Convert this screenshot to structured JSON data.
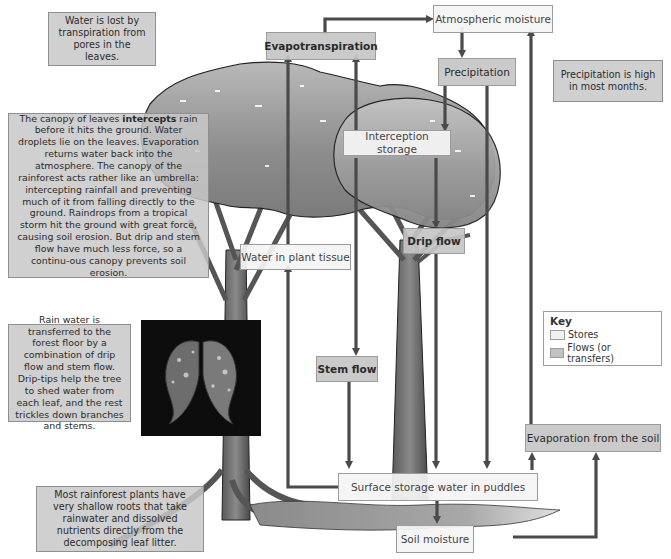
{
  "diagram": {
    "type": "rainforest nutrient/water cycle (stores and flows)",
    "colors": {
      "store_fill": "#f1f1f1",
      "flow_fill": "#c6c6c6",
      "arrow": "#4a4a4a",
      "note_fill": "#c8c8c8"
    }
  },
  "notes": {
    "transpiration": "Water is lost by transpiration from pores in the leaves.",
    "canopy_prefix": "The canopy of leaves ",
    "canopy_bold": "intercepts",
    "canopy_suffix": " rain before it hits the ground. Water droplets lie on the leaves. Evaporation returns water back into the atmosphere. The canopy of the rainforest acts rather like an umbrella: intercepting rainfall and preventing much of it from falling directly to the ground. Raindrops from a tropical storm hit the ground with great force, causing soil erosion. But drip and stem flow have much less force, so a continu-ous canopy prevents soil erosion.",
    "rain_transfer": "Rain water is transferred to the forest floor by a combination of drip flow and stem flow. Drip-tips help the tree to shed water from each leaf, and the rest trickles down branches and stems.",
    "roots": "Most rainforest plants have very shallow roots that take rainwater and dissolved nutrients directly from the decomposing leaf litter.",
    "precipitation_high": "Precipitation is high in most months."
  },
  "stores": {
    "atmospheric_moisture": "Atmospheric moisture",
    "interception_storage": "Interception storage",
    "water_in_plant_tissue": "Water in plant tissue",
    "surface_storage": "Surface storage water in puddles",
    "soil_moisture": "Soil moisture"
  },
  "flows": {
    "evapotranspiration": "Evapotranspiration",
    "precipitation": "Precipitation",
    "drip_flow": "Drip flow",
    "stem_flow": "Stem flow",
    "evaporation_from_soil": "Evaporation from the soil"
  },
  "key": {
    "title": "Key",
    "items": [
      {
        "label": "Stores",
        "type": "store"
      },
      {
        "label": "Flows (or transfers)",
        "type": "flow"
      }
    ]
  },
  "connections": [
    {
      "from": "Evapotranspiration",
      "to": "Atmospheric moisture"
    },
    {
      "from": "Atmospheric moisture",
      "to": "Precipitation"
    },
    {
      "from": "Precipitation",
      "to": "Interception storage"
    },
    {
      "from": "Precipitation",
      "to": "Surface storage water in puddles"
    },
    {
      "from": "Interception storage",
      "to": "Evapotranspiration"
    },
    {
      "from": "Interception storage",
      "to": "Stem flow"
    },
    {
      "from": "Interception storage",
      "to": "Drip flow"
    },
    {
      "from": "Water in plant tissue",
      "to": "Evapotranspiration"
    },
    {
      "from": "Drip flow",
      "to": "Surface storage water in puddles"
    },
    {
      "from": "Stem flow",
      "to": "Surface storage water in puddles"
    },
    {
      "from": "Surface storage water in puddles",
      "to": "Water in plant tissue"
    },
    {
      "from": "Surface storage water in puddles",
      "to": "Soil moisture"
    },
    {
      "from": "Surface storage water in puddles",
      "to": "Evaporation from the soil"
    },
    {
      "from": "Soil moisture",
      "to": "Evaporation from the soil"
    },
    {
      "from": "Evaporation from the soil",
      "to": "Atmospheric moisture"
    }
  ]
}
